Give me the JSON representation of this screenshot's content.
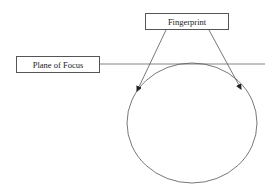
{
  "diagram": {
    "labels": {
      "fingerprint": "Fingerprint",
      "plane_of_focus": "Plane of Focus"
    },
    "elements": [
      {
        "type": "box",
        "label": "Fingerprint"
      },
      {
        "type": "box",
        "label": "Plane of Focus"
      },
      {
        "type": "line",
        "description": "horizontal plane of focus line"
      },
      {
        "type": "ellipse",
        "description": "curved surface"
      },
      {
        "type": "arrow",
        "from": "Fingerprint",
        "to": "left side of curved surface"
      },
      {
        "type": "arrow",
        "from": "Fingerprint",
        "to": "right side of curved surface"
      }
    ],
    "colors": {
      "stroke": "#555555",
      "background": "#ffffff"
    }
  }
}
